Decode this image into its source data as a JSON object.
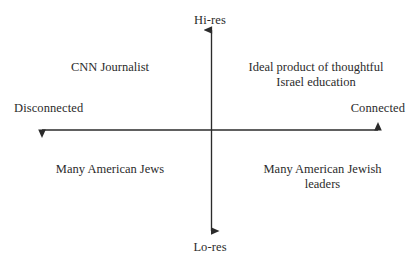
{
  "diagram": {
    "type": "two-by-two-matrix",
    "background_color": "#ffffff",
    "ink_color": "#2b2b2b",
    "axes": {
      "vertical": {
        "top_label": "Hi-res",
        "bottom_label": "Lo-res"
      },
      "horizontal": {
        "left_label": "Disconnected",
        "right_label": "Connected"
      }
    },
    "quadrants": {
      "top_left": {
        "line1": "CNN Journalist",
        "line2": ""
      },
      "top_right": {
        "line1": "Ideal product of thoughtful",
        "line2": "Israel education"
      },
      "bottom_left": {
        "line1": "Many American Jews",
        "line2": ""
      },
      "bottom_right": {
        "line1": "Many American Jewish",
        "line2": "leaders"
      }
    }
  }
}
